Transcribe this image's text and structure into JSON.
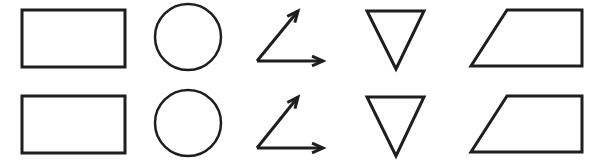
{
  "diagram": {
    "width": 598,
    "height": 165,
    "background": "#ffffff",
    "stroke_color": "#1e1e1e",
    "stroke_width": 3,
    "rows": [
      {
        "name": "row-1",
        "shapes": [
          {
            "type": "rectangle",
            "x": 22,
            "y": 10,
            "w": 103,
            "h": 57
          },
          {
            "type": "circle",
            "cx": 188,
            "cy": 37,
            "r": 33
          },
          {
            "type": "angle-arrows",
            "vertex": [
              257,
              61
            ],
            "tip_a": [
              298,
              11
            ],
            "tip_b": [
              323,
              61
            ]
          },
          {
            "type": "inverted-triangle",
            "points": [
              [
                367,
                11
              ],
              [
                424,
                11
              ],
              [
                396,
                69
              ]
            ]
          },
          {
            "type": "trapezoid",
            "points": [
              [
                507,
                10
              ],
              [
                582,
                10
              ],
              [
                582,
                66
              ],
              [
                471,
                66
              ]
            ]
          }
        ]
      },
      {
        "name": "row-2",
        "shapes": [
          {
            "type": "rectangle",
            "x": 22,
            "y": 96,
            "w": 103,
            "h": 57
          },
          {
            "type": "circle",
            "cx": 188,
            "cy": 123,
            "r": 33
          },
          {
            "type": "angle-arrows",
            "vertex": [
              257,
              148
            ],
            "tip_a": [
              298,
              97
            ],
            "tip_b": [
              323,
              148
            ]
          },
          {
            "type": "inverted-triangle",
            "points": [
              [
                367,
                97
              ],
              [
                424,
                97
              ],
              [
                396,
                156
              ]
            ]
          },
          {
            "type": "trapezoid",
            "points": [
              [
                507,
                96
              ],
              [
                582,
                96
              ],
              [
                582,
                152
              ],
              [
                471,
                152
              ]
            ]
          }
        ]
      }
    ]
  }
}
